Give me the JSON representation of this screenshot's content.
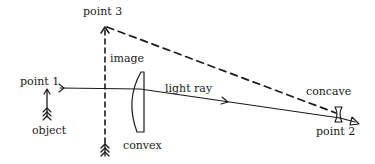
{
  "diagram": {
    "type": "optics-ray-diagram",
    "labels": {
      "point1": "point 1",
      "point2": "point 2",
      "point3": "point 3",
      "image": "image",
      "object": "object",
      "light_ray": "light ray",
      "convex": "convex",
      "concave": "concave"
    },
    "elements": [
      {
        "id": "object-arrow",
        "kind": "arrow",
        "style": "solid",
        "direction": "up"
      },
      {
        "id": "image-arrow",
        "kind": "arrow",
        "style": "dashed",
        "direction": "up"
      },
      {
        "id": "convex-lens",
        "kind": "lens",
        "shape": "convex"
      },
      {
        "id": "concave-lens",
        "kind": "lens",
        "shape": "concave"
      },
      {
        "id": "light-ray",
        "kind": "ray",
        "style": "solid",
        "from": "point 1",
        "to": "point 2"
      },
      {
        "id": "virtual-ray",
        "kind": "ray",
        "style": "dashed",
        "from": "point 2",
        "to": "point 3"
      }
    ],
    "colors": {
      "ink": "#1a1a1a",
      "background": "#ffffff"
    }
  }
}
